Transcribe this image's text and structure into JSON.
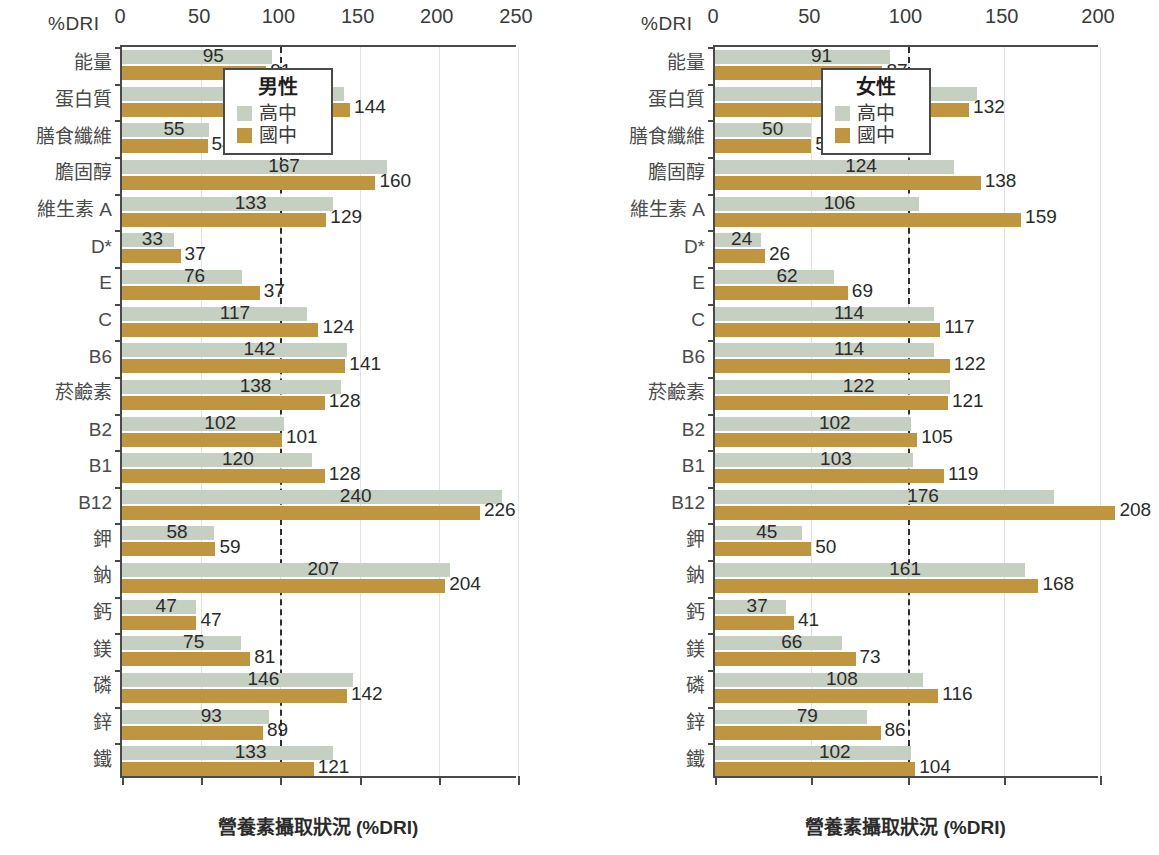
{
  "figure": {
    "dri_axis_label": "%DRI",
    "x_axis_title": "營養素攝取狀況 (%DRI)",
    "colors": {
      "high_school": "#c5d0c2",
      "junior_high": "#c09540",
      "reference_line": "#2e2e2e",
      "axis": "#4a4a4a"
    }
  },
  "chart_data": [
    {
      "type": "bar",
      "orientation": "horizontal",
      "title": "男性",
      "xlabel": "營養素攝取狀況 (%DRI)",
      "ylabel": "",
      "xlim": [
        0,
        250
      ],
      "xticks": [
        0,
        50,
        100,
        150,
        200,
        250
      ],
      "grid": true,
      "reference_line": 100,
      "legend_position": "top-right",
      "legend": [
        "高中",
        "國中"
      ],
      "categories": [
        "能量",
        "蛋白質",
        "膳食纖維",
        "膽固醇",
        "維生素 A",
        "D*",
        "E",
        "C",
        "B6",
        "菸鹼素",
        "B2",
        "B1",
        "B12",
        "鉀",
        "鈉",
        "鈣",
        "鎂",
        "磷",
        "鋅",
        "鐵"
      ],
      "series": [
        {
          "name": "高中",
          "color": "#c5d0c2",
          "values": [
            95,
            140,
            55,
            167,
            133,
            33,
            76,
            117,
            142,
            138,
            102,
            120,
            240,
            58,
            207,
            47,
            75,
            146,
            93,
            133
          ]
        },
        {
          "name": "國中",
          "color": "#c09540",
          "values": [
            91,
            144,
            54,
            160,
            129,
            37,
            37,
            124,
            141,
            128,
            101,
            128,
            226,
            59,
            204,
            47,
            81,
            142,
            89,
            121
          ],
          "bar_lengths": [
            91,
            144,
            54,
            160,
            129,
            37,
            87,
            124,
            141,
            128,
            101,
            128,
            226,
            59,
            204,
            47,
            81,
            142,
            89,
            121
          ]
        }
      ]
    },
    {
      "type": "bar",
      "orientation": "horizontal",
      "title": "女性",
      "xlabel": "營養素攝取狀況 (%DRI)",
      "ylabel": "",
      "xlim": [
        0,
        200
      ],
      "xticks": [
        0,
        50,
        100,
        150,
        200
      ],
      "grid": true,
      "reference_line": 100,
      "legend_position": "top-right",
      "legend": [
        "高中",
        "國中"
      ],
      "categories": [
        "能量",
        "蛋白質",
        "膳食纖維",
        "膽固醇",
        "維生素 A",
        "D*",
        "E",
        "C",
        "B6",
        "菸鹼素",
        "B2",
        "B1",
        "B12",
        "鉀",
        "鈉",
        "鈣",
        "鎂",
        "磷",
        "鋅",
        "鐵"
      ],
      "series": [
        {
          "name": "高中",
          "color": "#c5d0c2",
          "values": [
            91,
            136,
            50,
            124,
            106,
            24,
            62,
            114,
            114,
            122,
            102,
            103,
            176,
            45,
            161,
            37,
            66,
            108,
            79,
            102
          ]
        },
        {
          "name": "國中",
          "color": "#c09540",
          "values": [
            87,
            132,
            50,
            138,
            159,
            26,
            69,
            117,
            122,
            121,
            105,
            119,
            208,
            50,
            168,
            41,
            73,
            116,
            86,
            104
          ]
        }
      ]
    }
  ]
}
